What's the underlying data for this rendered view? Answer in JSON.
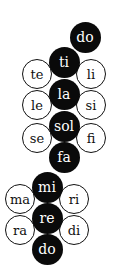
{
  "diagram": {
    "title": "",
    "colors": {
      "filled": "#0a0a0a",
      "open": "#ffffff",
      "stroke": "#111111"
    },
    "nodes": [
      {
        "id": "do-top",
        "label": "do",
        "type": "filled",
        "cx": 85,
        "cy": 37
      },
      {
        "id": "ti",
        "label": "ti",
        "type": "filled",
        "cx": 64,
        "cy": 62
      },
      {
        "id": "te",
        "label": "te",
        "type": "open",
        "cx": 37,
        "cy": 74
      },
      {
        "id": "li",
        "label": "li",
        "type": "open",
        "cx": 91,
        "cy": 74
      },
      {
        "id": "la",
        "label": "la",
        "type": "filled",
        "cx": 64,
        "cy": 94
      },
      {
        "id": "le",
        "label": "le",
        "type": "open",
        "cx": 37,
        "cy": 105
      },
      {
        "id": "si",
        "label": "si",
        "type": "open",
        "cx": 91,
        "cy": 105
      },
      {
        "id": "sol",
        "label": "sol",
        "type": "filled",
        "cx": 64,
        "cy": 126
      },
      {
        "id": "se",
        "label": "se",
        "type": "open",
        "cx": 37,
        "cy": 138
      },
      {
        "id": "fi",
        "label": "fi",
        "type": "open",
        "cx": 91,
        "cy": 138
      },
      {
        "id": "fa",
        "label": "fa",
        "type": "filled",
        "cx": 64,
        "cy": 157
      },
      {
        "id": "mi",
        "label": "mi",
        "type": "filled",
        "cx": 47,
        "cy": 187
      },
      {
        "id": "ma",
        "label": "ma",
        "type": "open",
        "cx": 20,
        "cy": 199
      },
      {
        "id": "ri",
        "label": "ri",
        "type": "open",
        "cx": 74,
        "cy": 199
      },
      {
        "id": "re",
        "label": "re",
        "type": "filled",
        "cx": 47,
        "cy": 218
      },
      {
        "id": "ra",
        "label": "ra",
        "type": "open",
        "cx": 20,
        "cy": 230
      },
      {
        "id": "di",
        "label": "di",
        "type": "open",
        "cx": 74,
        "cy": 230
      },
      {
        "id": "do-bottom",
        "label": "do",
        "type": "filled",
        "cx": 47,
        "cy": 249
      }
    ]
  }
}
